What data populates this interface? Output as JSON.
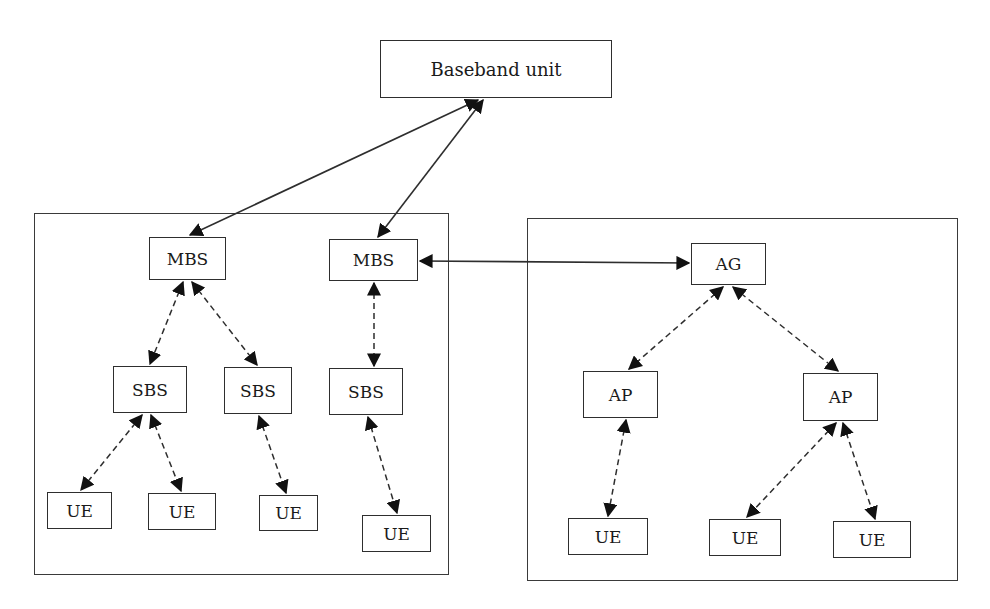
{
  "diagram": {
    "colors": {
      "stroke": "#2e2e2e",
      "background": "#ffffff",
      "text": "#1a1a1a"
    },
    "nodes": {
      "bbu": {
        "label": "Baseband unit",
        "x": 380,
        "y": 40,
        "w": 232,
        "h": 58
      },
      "mbs1": {
        "label": "MBS",
        "x": 149,
        "y": 237,
        "w": 77,
        "h": 43
      },
      "mbs2": {
        "label": "MBS",
        "x": 329,
        "y": 239,
        "w": 89,
        "h": 42
      },
      "sbs1": {
        "label": "SBS",
        "x": 113,
        "y": 366,
        "w": 74,
        "h": 47
      },
      "sbs2": {
        "label": "SBS",
        "x": 224,
        "y": 367,
        "w": 68,
        "h": 47
      },
      "sbs3": {
        "label": "SBS",
        "x": 329,
        "y": 368,
        "w": 74,
        "h": 47
      },
      "ue1": {
        "label": "UE",
        "x": 47,
        "y": 492,
        "w": 65,
        "h": 37
      },
      "ue2": {
        "label": "UE",
        "x": 148,
        "y": 493,
        "w": 68,
        "h": 37
      },
      "ue3": {
        "label": "UE",
        "x": 259,
        "y": 495,
        "w": 59,
        "h": 36
      },
      "ue4": {
        "label": "UE",
        "x": 362,
        "y": 515,
        "w": 69,
        "h": 37
      },
      "ag": {
        "label": "AG",
        "x": 691,
        "y": 243,
        "w": 75,
        "h": 42
      },
      "ap1": {
        "label": "AP",
        "x": 583,
        "y": 371,
        "w": 75,
        "h": 47
      },
      "ap2": {
        "label": "AP",
        "x": 803,
        "y": 373,
        "w": 75,
        "h": 48
      },
      "ue5": {
        "label": "UE",
        "x": 568,
        "y": 518,
        "w": 80,
        "h": 37
      },
      "ue6": {
        "label": "UE",
        "x": 709,
        "y": 519,
        "w": 72,
        "h": 37
      },
      "ue7": {
        "label": "UE",
        "x": 833,
        "y": 521,
        "w": 78,
        "h": 37
      }
    },
    "containers": {
      "cellular_group": {
        "x": 34,
        "y": 213,
        "w": 415,
        "h": 362
      },
      "access_group": {
        "x": 527,
        "y": 218,
        "w": 431,
        "h": 363
      }
    },
    "edges": [
      {
        "from": "bbu",
        "to": "mbs1",
        "style": "solid",
        "x1": 478,
        "y1": 100,
        "x2": 190,
        "y2": 235
      },
      {
        "from": "bbu",
        "to": "mbs2",
        "style": "solid",
        "x1": 483,
        "y1": 100,
        "x2": 378,
        "y2": 237
      },
      {
        "from": "mbs2",
        "to": "ag",
        "style": "solid",
        "x1": 420,
        "y1": 261,
        "x2": 689,
        "y2": 263
      },
      {
        "from": "mbs1",
        "to": "sbs1",
        "style": "dashed",
        "x1": 183,
        "y1": 282,
        "x2": 150,
        "y2": 364
      },
      {
        "from": "mbs1",
        "to": "sbs2",
        "style": "dashed",
        "x1": 192,
        "y1": 282,
        "x2": 257,
        "y2": 365
      },
      {
        "from": "mbs2",
        "to": "sbs3",
        "style": "dashed",
        "x1": 374,
        "y1": 283,
        "x2": 374,
        "y2": 366
      },
      {
        "from": "sbs1",
        "to": "ue1",
        "style": "dashed",
        "x1": 142,
        "y1": 415,
        "x2": 81,
        "y2": 490
      },
      {
        "from": "sbs1",
        "to": "ue2",
        "style": "dashed",
        "x1": 151,
        "y1": 415,
        "x2": 181,
        "y2": 491
      },
      {
        "from": "sbs2",
        "to": "ue3",
        "style": "dashed",
        "x1": 259,
        "y1": 416,
        "x2": 286,
        "y2": 493
      },
      {
        "from": "sbs3",
        "to": "ue4",
        "style": "dashed",
        "x1": 368,
        "y1": 417,
        "x2": 397,
        "y2": 513
      },
      {
        "from": "ag",
        "to": "ap1",
        "style": "dashed",
        "x1": 723,
        "y1": 287,
        "x2": 629,
        "y2": 369
      },
      {
        "from": "ag",
        "to": "ap2",
        "style": "dashed",
        "x1": 733,
        "y1": 287,
        "x2": 838,
        "y2": 371
      },
      {
        "from": "ap1",
        "to": "ue5",
        "style": "dashed",
        "x1": 626,
        "y1": 420,
        "x2": 608,
        "y2": 516
      },
      {
        "from": "ap2",
        "to": "ue6",
        "style": "dashed",
        "x1": 836,
        "y1": 423,
        "x2": 747,
        "y2": 517
      },
      {
        "from": "ap2",
        "to": "ue7",
        "style": "dashed",
        "x1": 843,
        "y1": 423,
        "x2": 875,
        "y2": 519
      }
    ]
  }
}
